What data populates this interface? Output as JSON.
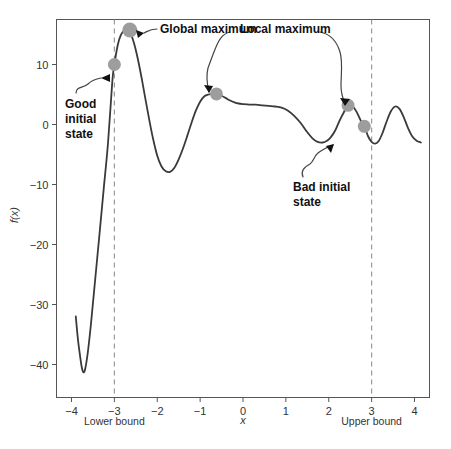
{
  "chart_data": {
    "type": "line",
    "title": "",
    "subtitle": "",
    "xlabel": "x",
    "ylabel": "f(x)",
    "xlim": [
      -4.35,
      4.35
    ],
    "ylim": [
      -45.5,
      17.5
    ],
    "grid": false,
    "legend_position": "none",
    "x_ticks": [
      "−4",
      "−3",
      "−2",
      "−1",
      "0",
      "1",
      "2",
      "3",
      "4"
    ],
    "x_tick_values": [
      -4,
      -3,
      -2,
      -1,
      0,
      1,
      2,
      3,
      4
    ],
    "y_ticks": [
      "10",
      "0",
      "−10",
      "−20",
      "−30",
      "−40"
    ],
    "y_tick_values": [
      10,
      0,
      -10,
      -20,
      -30,
      -40
    ],
    "series": [
      {
        "name": "f(x)",
        "color": "#3a3a3a",
        "x": [
          -3.9,
          -3.85,
          -3.8,
          -3.76,
          -3.72,
          -3.68,
          -3.62,
          -3.55,
          -3.45,
          -3.35,
          -3.25,
          -3.15,
          -3.05,
          -3.0,
          -2.92,
          -2.85,
          -2.78,
          -2.72,
          -2.66,
          -2.6,
          -2.54,
          -2.48,
          -2.42,
          -2.35,
          -2.28,
          -2.2,
          -2.1,
          -2.0,
          -1.9,
          -1.8,
          -1.7,
          -1.6,
          -1.5,
          -1.4,
          -1.3,
          -1.2,
          -1.1,
          -1.0,
          -0.9,
          -0.8,
          -0.7,
          -0.6,
          -0.5,
          -0.4,
          -0.3,
          -0.2,
          -0.1,
          0.0,
          0.15,
          0.3,
          0.45,
          0.6,
          0.75,
          0.9,
          1.05,
          1.2,
          1.35,
          1.5,
          1.62,
          1.74,
          1.86,
          1.96,
          2.05,
          2.15,
          2.25,
          2.35,
          2.45,
          2.55,
          2.65,
          2.75,
          2.83,
          2.92,
          3.0,
          3.08,
          3.16,
          3.25,
          3.35,
          3.45,
          3.55,
          3.65,
          3.75,
          3.85,
          3.95,
          4.05,
          4.15
        ],
        "y": [
          -32.0,
          -35.8,
          -38.6,
          -40.5,
          -41.3,
          -40.7,
          -38.0,
          -33.5,
          -26.0,
          -18.5,
          -10.8,
          -3.2,
          7.0,
          10.0,
          13.3,
          14.9,
          15.6,
          15.7,
          15.5,
          14.8,
          13.5,
          11.8,
          9.8,
          7.2,
          4.4,
          1.3,
          -2.3,
          -5.2,
          -7.0,
          -7.8,
          -7.9,
          -7.2,
          -5.8,
          -4.0,
          -1.9,
          0.3,
          2.3,
          3.8,
          4.7,
          5.0,
          5.1,
          5.1,
          4.8,
          4.4,
          4.0,
          3.7,
          3.5,
          3.4,
          3.3,
          3.3,
          3.2,
          3.1,
          3.0,
          2.8,
          2.3,
          1.4,
          0.2,
          -1.3,
          -2.3,
          -2.9,
          -3.0,
          -2.7,
          -2.1,
          -1.0,
          0.6,
          2.0,
          3.2,
          3.1,
          2.1,
          0.6,
          -0.3,
          -2.0,
          -2.9,
          -3.2,
          -2.8,
          -1.5,
          0.5,
          2.2,
          3.0,
          2.6,
          1.2,
          -0.6,
          -2.0,
          -2.7,
          -3.0
        ]
      }
    ],
    "markers": [
      {
        "name": "good-initial-state",
        "x": -3.0,
        "y": 10.0,
        "radius": 6.5,
        "color": "#9d9d9d"
      },
      {
        "name": "global-maximum",
        "x": -2.64,
        "y": 15.75,
        "radius": 7.5,
        "color": "#9d9d9d"
      },
      {
        "name": "local-maximum-left",
        "x": -0.62,
        "y": 5.1,
        "radius": 6.5,
        "color": "#9d9d9d"
      },
      {
        "name": "local-maximum-right",
        "x": 2.45,
        "y": 3.2,
        "radius": 6.5,
        "color": "#9d9d9d"
      },
      {
        "name": "bad-initial-state",
        "x": 2.83,
        "y": -0.3,
        "radius": 6.5,
        "color": "#9d9d9d"
      }
    ],
    "vlines": [
      {
        "name": "lower-bound",
        "x": -3.0,
        "label": "Lower bound",
        "style": "dashed",
        "color": "#9a9a9a"
      },
      {
        "name": "upper-bound",
        "x": 3.0,
        "label": "Upper bound",
        "style": "dashed",
        "color": "#9a9a9a"
      }
    ],
    "annotations": [
      {
        "name": "global-maximum",
        "text": "Global maximum",
        "lines": [
          "Global maximum"
        ]
      },
      {
        "name": "good-initial-state",
        "text": "Good initial state",
        "lines": [
          "Good",
          "initial",
          "state"
        ]
      },
      {
        "name": "local-maximum",
        "text": "Local maximum",
        "lines": [
          "Local maximum"
        ]
      },
      {
        "name": "bad-initial-state",
        "text": "Bad initial state",
        "lines": [
          "Bad initial",
          "state"
        ]
      }
    ],
    "colors": {
      "curve": "#3a3a3a",
      "marker": "#9d9d9d",
      "bound_line": "#9a9a9a",
      "frame": "#555555",
      "text": "#111111",
      "background": "#ffffff"
    }
  },
  "axes": {
    "x_label": "x",
    "y_label": "f(x)",
    "x_tick_labels": [
      "−4",
      "−3",
      "−2",
      "−1",
      "0",
      "1",
      "2",
      "3",
      "4"
    ],
    "y_tick_labels": [
      "10",
      "0",
      "−10",
      "−20",
      "−30",
      "−40"
    ]
  },
  "bounds": {
    "lower_label": "Lower bound",
    "upper_label": "Upper bound"
  },
  "annotations": {
    "global_maximum": "Global maximum",
    "local_maximum": "Local maximum",
    "good_initial_state_line1": "Good",
    "good_initial_state_line2": "initial",
    "good_initial_state_line3": "state",
    "bad_initial_state_line1": "Bad initial",
    "bad_initial_state_line2": "state"
  }
}
